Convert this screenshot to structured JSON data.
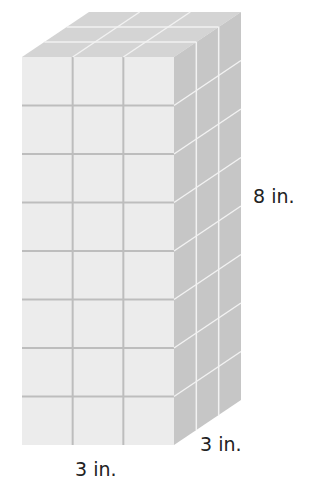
{
  "figure": {
    "dimensions": {
      "height_label": "8 in.",
      "depth_label": "3 in.",
      "width_label": "3 in."
    },
    "grid": {
      "rows": 8,
      "cols": 3,
      "depth": 3
    },
    "colors": {
      "front": "#ececec",
      "top": "#d4d4d4",
      "side": "#c6c6c6",
      "grid_line": "#bdbdbd",
      "highlight_line": "#f2f2f2"
    }
  }
}
